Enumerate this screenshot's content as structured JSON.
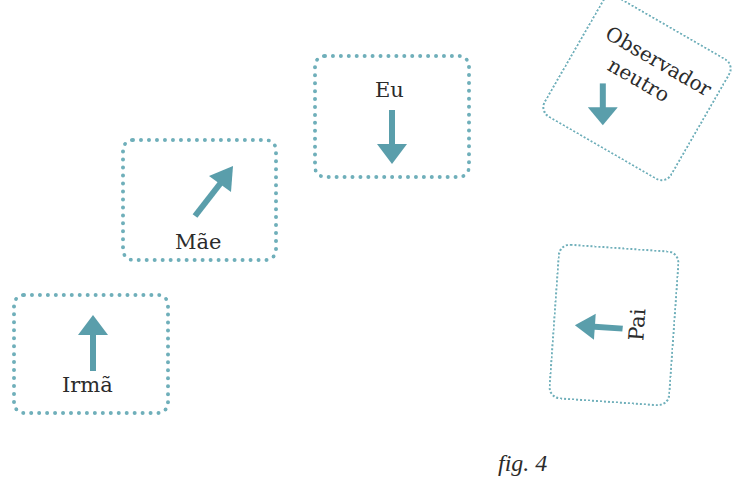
{
  "colors": {
    "border": "#6fafba",
    "arrow": "#5a9eab",
    "text": "#2b2b2b"
  },
  "cards": {
    "irma": {
      "label": "Irmã",
      "arrow": "arrow-up"
    },
    "mae": {
      "label": "Mãe",
      "arrow": "arrow-up-right"
    },
    "eu": {
      "label": "Eu",
      "arrow": "arrow-down"
    },
    "observador": {
      "line1": "Observador",
      "line2": "neutro",
      "arrow": "arrow-down-left"
    },
    "pai": {
      "label": "Pai",
      "arrow": "arrow-left"
    }
  },
  "caption": "fig. 4"
}
